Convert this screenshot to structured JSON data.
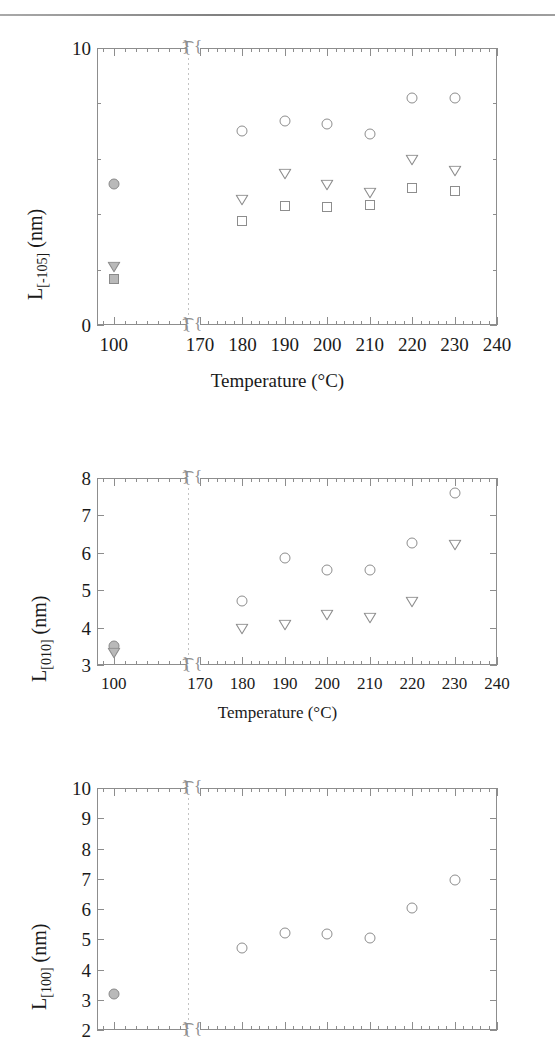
{
  "figure": {
    "kind": "three-panel-scatter",
    "shared_xaxis_title": "Temperature (°C)",
    "xaxis_break": true,
    "xaxis_left_ticks": [
      "100"
    ],
    "xaxis_right_ticks": [
      "170",
      "180",
      "190",
      "200",
      "210",
      "220",
      "230",
      "240"
    ],
    "marker_note_100c": "filled-gray"
  },
  "chart_data": [
    {
      "type": "scatter",
      "title": "",
      "xlabel": "Temperature (°C)",
      "ylabel": "L[-105] (nm)",
      "ylabel_base": "L",
      "ylabel_sub": "[-105]",
      "ylabel_unit": "(nm)",
      "ylim": [
        0,
        10
      ],
      "yticks": [
        0,
        10
      ],
      "yminor": [
        2,
        4,
        6,
        8
      ],
      "ytick_labels": [
        "0",
        "10"
      ],
      "xlim_left": [
        85,
        165
      ],
      "xlim_right": [
        170,
        240
      ],
      "grid": false,
      "legend": "none",
      "series": [
        {
          "name": "circle",
          "marker": "circle",
          "x": [
            100,
            180,
            190,
            200,
            210,
            220,
            230
          ],
          "y": [
            5.1,
            7.0,
            7.35,
            7.25,
            6.9,
            8.2,
            8.2
          ],
          "filled_index": [
            0
          ]
        },
        {
          "name": "down-triangle",
          "marker": "triangle-down",
          "x": [
            100,
            180,
            190,
            200,
            210,
            220,
            230
          ],
          "y": [
            2.1,
            4.5,
            5.45,
            5.05,
            4.75,
            5.95,
            5.55
          ],
          "filled_index": [
            0
          ]
        },
        {
          "name": "square",
          "marker": "square",
          "x": [
            100,
            180,
            190,
            200,
            210,
            220,
            230
          ],
          "y": [
            1.65,
            3.75,
            4.3,
            4.25,
            4.35,
            4.95,
            4.85
          ],
          "filled_index": [
            0
          ]
        }
      ]
    },
    {
      "type": "scatter",
      "title": "",
      "xlabel": "Temperature (°C)",
      "ylabel": "L[010] (nm)",
      "ylabel_base": "L",
      "ylabel_sub": "[010]",
      "ylabel_unit": "(nm)",
      "ylim": [
        3,
        8
      ],
      "yticks": [
        3,
        4,
        5,
        6,
        7,
        8
      ],
      "ytick_labels": [
        "3",
        "4",
        "5",
        "6",
        "7",
        "8"
      ],
      "xlim_left": [
        85,
        165
      ],
      "xlim_right": [
        170,
        240
      ],
      "grid": false,
      "legend": "none",
      "series": [
        {
          "name": "circle",
          "marker": "circle",
          "x": [
            100,
            180,
            190,
            200,
            210,
            220,
            230
          ],
          "y": [
            3.5,
            4.72,
            5.85,
            5.54,
            5.54,
            6.27,
            7.6
          ],
          "filled_index": [
            0
          ]
        },
        {
          "name": "down-triangle",
          "marker": "triangle-down",
          "x": [
            100,
            180,
            190,
            200,
            210,
            220,
            230
          ],
          "y": [
            3.33,
            3.96,
            4.06,
            4.33,
            4.25,
            4.68,
            6.2
          ],
          "filled_index": [
            0
          ]
        }
      ]
    },
    {
      "type": "scatter",
      "title": "",
      "xlabel": "Temperature (°C)",
      "ylabel": "L[100] (nm)",
      "ylabel_base": "L",
      "ylabel_sub": "[100]",
      "ylabel_unit": "(nm)",
      "ylim": [
        2,
        10
      ],
      "yticks": [
        2,
        3,
        4,
        5,
        6,
        7,
        8,
        9,
        10
      ],
      "ytick_labels": [
        "2",
        "3",
        "4",
        "5",
        "6",
        "7",
        "8",
        "9",
        "10"
      ],
      "xlim_left": [
        85,
        165
      ],
      "xlim_right": [
        170,
        240
      ],
      "grid": false,
      "legend": "none",
      "cropped_bottom": true,
      "series": [
        {
          "name": "circle",
          "marker": "circle",
          "x": [
            100,
            180,
            190,
            200,
            210,
            220,
            230
          ],
          "y": [
            3.18,
            4.72,
            5.2,
            5.18,
            5.03,
            6.03,
            6.97
          ],
          "filled_index": [
            0
          ]
        }
      ]
    }
  ]
}
